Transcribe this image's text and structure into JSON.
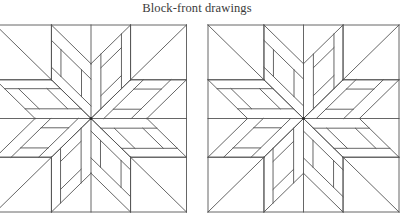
{
  "title": "Block-front drawings",
  "colors": {
    "line": "#555555",
    "background": "#ffffff",
    "title": "#3a3a3a"
  },
  "blocks": [
    {
      "name": "left-block-drawing",
      "center": [
        91,
        118.5
      ],
      "half_width": 95.5,
      "half_height": 93.5
    },
    {
      "name": "right-block-drawing",
      "center": [
        303.5,
        118.5
      ],
      "half_width": 95.5,
      "half_height": 93.5
    }
  ],
  "pattern": {
    "type": "eight-point-star-pinwheel",
    "diamond_edge": 56,
    "arm_a": {
      "bands": [
        0.23,
        0.72
      ],
      "crosses": [
        0.24,
        0.76
      ]
    },
    "arm_b": {
      "bands": [
        0.25,
        0.77
      ],
      "crosses": [
        0.24,
        0.75
      ]
    }
  }
}
